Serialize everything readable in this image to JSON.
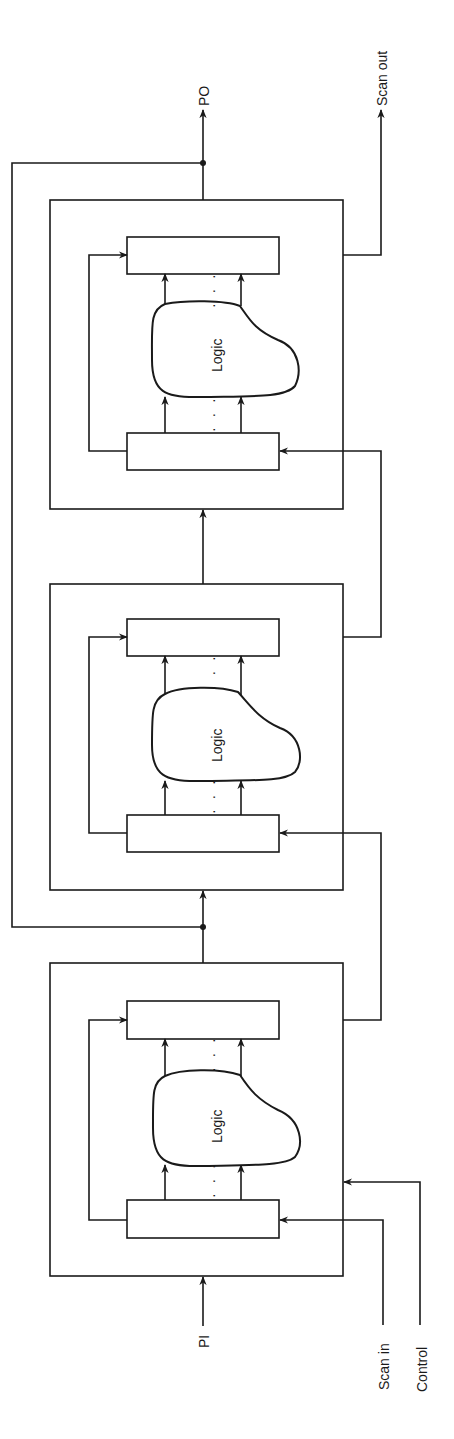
{
  "diagram": {
    "type": "scan-chain-pipeline",
    "orientation": "rotated-90",
    "colors": {
      "line": "#1a1a1a",
      "background": "#ffffff"
    },
    "signals": {
      "primary_input": "PI",
      "primary_output": "PO",
      "scan_in": "Scan in",
      "scan_out": "Scan out",
      "control": "Control"
    },
    "blocks": [
      {
        "id": "stage-1",
        "logic_label": "Logic",
        "ellipsis": "· · ·"
      },
      {
        "id": "stage-2",
        "logic_label": "Logic",
        "ellipsis": "· · ·"
      },
      {
        "id": "stage-3",
        "logic_label": "Logic",
        "ellipsis": "· · ·"
      }
    ]
  }
}
